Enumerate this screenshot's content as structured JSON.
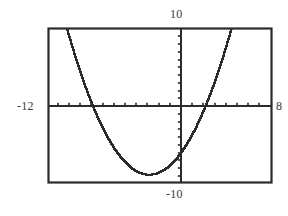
{
  "chart_data": {
    "type": "line",
    "title": "",
    "subtitle": "",
    "xlabel": "",
    "ylabel": "",
    "grid": false,
    "legend": null,
    "xlim": [
      -12,
      8
    ],
    "ylim": [
      -10,
      10
    ],
    "xscl": 1,
    "yscl": 1,
    "window_labels": {
      "xmin": "-12",
      "xmax": "8",
      "ymin": "-10",
      "ymax": "10"
    },
    "annotations": [],
    "series": [
      {
        "name": "parabola",
        "shape": "upward-opening parabola",
        "vertex": [
          -3,
          -8.8
        ],
        "roots": [
          -8,
          2
        ],
        "y_intercept": -6.4,
        "a": 0.35,
        "style": "pixelated",
        "color": "#2b2b2b",
        "x": [
          -12.0,
          -11.5,
          -11.0,
          -10.5,
          -10.0,
          -9.5,
          -9.0,
          -8.5,
          -8.0,
          -7.5,
          -7.0,
          -6.5,
          -6.0,
          -5.5,
          -5.0,
          -4.5,
          -4.0,
          -3.5,
          -3.0,
          -2.5,
          -2.0,
          -1.5,
          -1.0,
          -0.5,
          0.0,
          0.5,
          1.0,
          1.5,
          2.0,
          2.5,
          3.0,
          3.5,
          4.0,
          4.5,
          5.0,
          5.5,
          6.0,
          6.5,
          7.0,
          7.5,
          8.0
        ],
        "y": [
          19.55,
          15.96,
          12.6,
          9.46,
          6.55,
          3.86,
          1.4,
          -0.84,
          -2.85,
          -4.64,
          -6.2,
          -7.54,
          -8.65,
          -9.54,
          -10.2,
          -10.64,
          -10.85,
          -10.84,
          -10.6,
          -10.14,
          -9.45,
          -8.54,
          -7.4,
          -6.04,
          -4.45,
          -2.64,
          -0.6,
          1.66,
          4.15,
          6.86,
          9.8,
          12.96,
          16.35,
          19.96,
          23.8,
          27.86,
          32.15,
          36.66,
          41.4,
          46.36,
          51.55
        ]
      }
    ]
  },
  "plot_frame": {
    "left": 48,
    "top": 28,
    "right": 272,
    "bottom": 183,
    "border_color": "#2b2b2b",
    "background": "#ffffff"
  },
  "axes": {
    "x_axis_pixel_y": 106,
    "y_axis_pixel_x": 181,
    "x_tick_spacing_px": 11.2,
    "y_tick_spacing_px": 7.75,
    "color": "#2b2b2b"
  },
  "icons": {
    "graph": "function-graph-icon"
  }
}
